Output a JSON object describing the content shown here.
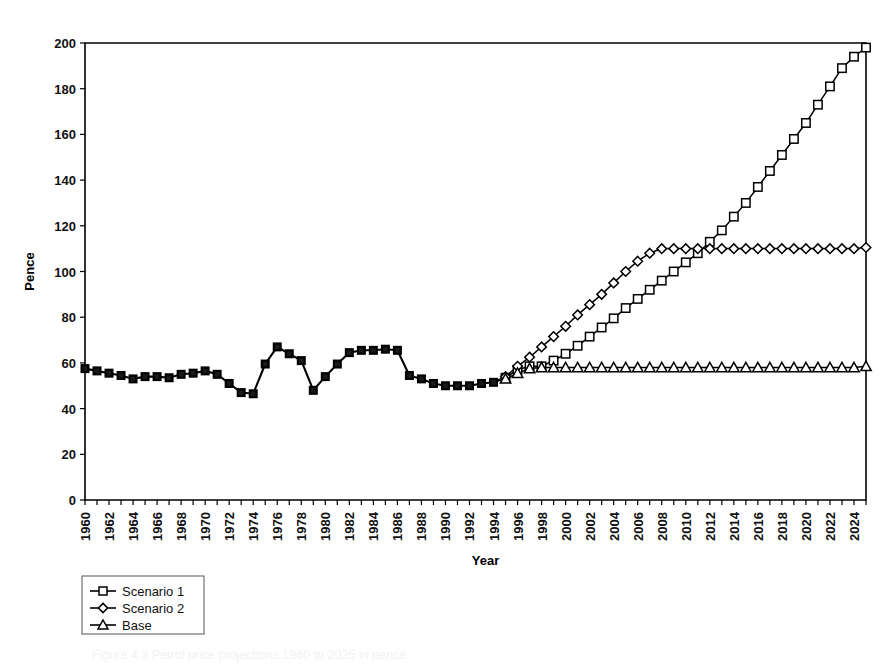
{
  "figure": {
    "caption": "Figure 4.3   Petrol price projections 1960 to 2025 in pence"
  },
  "chart_data": {
    "type": "line",
    "title": "",
    "xlabel": "Year",
    "ylabel": "Pence",
    "xlim": [
      1960,
      2025
    ],
    "ylim": [
      0,
      200
    ],
    "ytick_step": 20,
    "xtick_step": 1,
    "xticklabel_step": 2,
    "grid": false,
    "legend_position": "below-left",
    "yticks": [
      0,
      20,
      40,
      60,
      80,
      100,
      120,
      140,
      160,
      180,
      200
    ],
    "xticklabels": [
      "1960",
      "1962",
      "1964",
      "1966",
      "1968",
      "1970",
      "1972",
      "1974",
      "1976",
      "1978",
      "1980",
      "1982",
      "1984",
      "1986",
      "1988",
      "1990",
      "1992",
      "1994",
      "1996",
      "1998",
      "2000",
      "2002",
      "2004",
      "2006",
      "2008",
      "2010",
      "2012",
      "2014",
      "2016",
      "2018",
      "2020",
      "2022",
      "2024"
    ],
    "x": [
      1960,
      1961,
      1962,
      1963,
      1964,
      1965,
      1966,
      1967,
      1968,
      1969,
      1970,
      1971,
      1972,
      1973,
      1974,
      1975,
      1976,
      1977,
      1978,
      1979,
      1980,
      1981,
      1982,
      1983,
      1984,
      1985,
      1986,
      1987,
      1988,
      1989,
      1990,
      1991,
      1992,
      1993,
      1994,
      1995,
      1996,
      1997,
      1998,
      1999,
      2000,
      2001,
      2002,
      2003,
      2004,
      2005,
      2006,
      2007,
      2008,
      2009,
      2010,
      2011,
      2012,
      2013,
      2014,
      2015,
      2016,
      2017,
      2018,
      2019,
      2020,
      2021,
      2022,
      2023,
      2024,
      2025
    ],
    "series": [
      {
        "name": "Scenario 1",
        "marker": "square",
        "values": [
          57.5,
          56.5,
          55.5,
          54.5,
          53,
          54,
          54,
          53.5,
          55,
          55.5,
          56.5,
          55,
          51,
          47,
          46.5,
          59.5,
          67,
          64,
          61,
          48,
          54,
          59.5,
          64.5,
          65.5,
          65.5,
          66,
          65.5,
          54.5,
          53,
          51,
          50,
          50,
          50,
          51,
          51.5,
          53.5,
          57,
          58.5,
          58.5,
          61,
          64,
          67.5,
          71.5,
          75.5,
          79.5,
          84,
          88,
          92,
          96,
          100,
          104,
          108,
          113,
          118,
          124,
          130,
          137,
          144,
          151,
          158,
          165,
          173,
          181,
          189,
          194,
          198
        ]
      },
      {
        "name": "Scenario 2",
        "marker": "diamond",
        "values": [
          57.5,
          56.5,
          55.5,
          54.5,
          53,
          54,
          54,
          53.5,
          55,
          55.5,
          56.5,
          55,
          51,
          47,
          46.5,
          59.5,
          67,
          64,
          61,
          48,
          54,
          59.5,
          64.5,
          65.5,
          65.5,
          66,
          65.5,
          54.5,
          53,
          51,
          50,
          50,
          50,
          51,
          51.5,
          54,
          58.5,
          62.5,
          67,
          71.5,
          76,
          81,
          85.5,
          90,
          95,
          100,
          104.5,
          108,
          110,
          110,
          110,
          110,
          110,
          110,
          110,
          110,
          110,
          110,
          110,
          110,
          110,
          110,
          110,
          110,
          110,
          110.5
        ]
      },
      {
        "name": "Base",
        "marker": "triangle",
        "values": [
          57.5,
          56.5,
          55.5,
          54.5,
          53,
          54,
          54,
          53.5,
          55,
          55.5,
          56.5,
          55,
          51,
          47,
          46.5,
          59.5,
          67,
          64,
          61,
          48,
          54,
          59.5,
          64.5,
          65.5,
          65.5,
          66,
          65.5,
          54.5,
          53,
          51,
          50,
          50,
          50,
          51,
          51.5,
          53,
          55.5,
          57.5,
          58,
          58,
          58,
          58,
          58,
          58,
          58,
          58,
          58,
          58,
          58,
          58,
          58,
          58,
          58,
          58,
          58,
          58,
          58,
          58,
          58,
          58,
          58,
          58,
          58,
          58,
          58,
          58.5
        ]
      }
    ],
    "history_end_year": 1994
  }
}
